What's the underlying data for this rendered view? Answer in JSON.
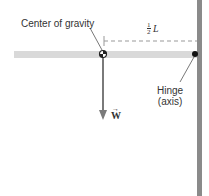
{
  "diagram": {
    "labels": {
      "center_of_gravity": "Center of gravity",
      "half": "1",
      "half_den": "2",
      "length": "L",
      "hinge_line1": "Hinge",
      "hinge_line2": "(axis)",
      "weight": "W"
    },
    "colors": {
      "rod": "#d9d9d9",
      "wall": "#8a8a8a",
      "arrow": "#7a7a7a",
      "dash": "#999999"
    }
  }
}
